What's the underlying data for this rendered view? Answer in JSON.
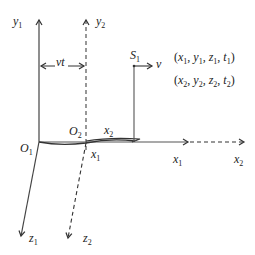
{
  "diagram": {
    "type": "two reference frames (Galilean transformation)",
    "frame1": {
      "origin": "O1",
      "axes": {
        "x": "x1",
        "y": "y1",
        "z": "z1"
      },
      "style": "solid"
    },
    "frame2": {
      "origin": "O2",
      "axes": {
        "x": "x2",
        "y": "y2",
        "z": "z2"
      },
      "style": "dashed"
    },
    "displacement_label": "vt",
    "observer": {
      "label": "S1",
      "velocity_label": "v"
    },
    "event_coordinates": [
      {
        "label": "(x1, y1, z1, t1)",
        "parts": [
          "x",
          "1",
          "y",
          "1",
          "z",
          "1",
          "t",
          "1"
        ]
      },
      {
        "label": "(x2, y2, z2, t2)",
        "parts": [
          "x",
          "2",
          "y",
          "2",
          "z",
          "2",
          "t",
          "2"
        ]
      }
    ],
    "colors": {
      "line": "#333333",
      "text": "#222222",
      "background": "#ffffff"
    }
  },
  "labels": {
    "y1": {
      "base": "y",
      "sub": "1"
    },
    "y2": {
      "base": "y",
      "sub": "2"
    },
    "vt": "vt",
    "S1": {
      "base": "S",
      "sub": "1"
    },
    "v": "v",
    "O1": {
      "base": "O",
      "sub": "1"
    },
    "O2": {
      "base": "O",
      "sub": "2"
    },
    "x2_top": {
      "base": "x",
      "sub": "2"
    },
    "x1_under": {
      "base": "x",
      "sub": "1"
    },
    "x1_axis": {
      "base": "x",
      "sub": "1"
    },
    "x2_axis": {
      "base": "x",
      "sub": "2"
    },
    "z1": {
      "base": "z",
      "sub": "1"
    },
    "z2": {
      "base": "z",
      "sub": "2"
    },
    "coord1": {
      "x": "x",
      "xs": "1",
      "y": "y",
      "ys": "1",
      "z": "z",
      "zs": "1",
      "t": "t",
      "ts": "1"
    },
    "coord2": {
      "x": "x",
      "xs": "2",
      "y": "y",
      "ys": "2",
      "z": "z",
      "zs": "2",
      "t": "t",
      "ts": "2"
    }
  }
}
